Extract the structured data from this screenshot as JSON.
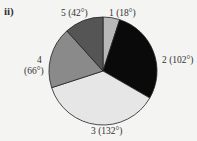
{
  "chart_data": {
    "type": "pie",
    "title": "ii)",
    "unit": "degrees",
    "categories": [
      "1",
      "2",
      "3",
      "4",
      "5"
    ],
    "values": [
      18,
      102,
      132,
      66,
      42
    ],
    "labels": [
      "1 (18°)",
      "2 (102°)",
      "3 (132°)",
      "4 (66°)",
      "5 (42°)"
    ],
    "colors": [
      "#b8b8b8",
      "#0a0a0a",
      "#e6e6e6",
      "#8a8a8a",
      "#555555"
    ],
    "start_angle_deg_clockwise_from_top": 0
  },
  "labels": {
    "panel": "ii)",
    "s1": "1 (18°)",
    "s2": "2 (102°)",
    "s3": "3 (132°)",
    "s4a": "4",
    "s4b": "(66°)",
    "s5": "5 (42°)"
  }
}
